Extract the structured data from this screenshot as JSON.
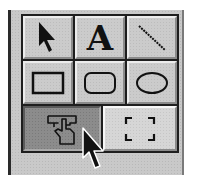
{
  "toolbox": {
    "name": "drawing-tools-palette",
    "tools": [
      {
        "id": "select",
        "icon": "arrow-pointer-icon",
        "label": "",
        "state": "normal"
      },
      {
        "id": "text",
        "icon": "text-tool-icon",
        "label": "A",
        "state": "normal"
      },
      {
        "id": "line",
        "icon": "line-tool-icon",
        "label": "",
        "state": "normal"
      },
      {
        "id": "rectangle",
        "icon": "rectangle-tool-icon",
        "label": "",
        "state": "normal"
      },
      {
        "id": "rounded-rectangle",
        "icon": "rounded-rectangle-tool-icon",
        "label": "",
        "state": "normal"
      },
      {
        "id": "oval",
        "icon": "oval-tool-icon",
        "label": "",
        "state": "normal"
      },
      {
        "id": "grabber",
        "icon": "hand-grabber-icon",
        "label": "",
        "state": "pressed"
      },
      {
        "id": "marquee",
        "icon": "marquee-selection-icon",
        "label": "",
        "state": "normal"
      }
    ]
  },
  "cursor": {
    "icon": "mouse-cursor-icon",
    "over": "grabber"
  },
  "colors": {
    "panel": "#c9c9c9",
    "grid_lines": "#1e1e1e",
    "button": "#cbcbcb",
    "pressed_button": "#8c8c8c",
    "icon": "#111111"
  }
}
